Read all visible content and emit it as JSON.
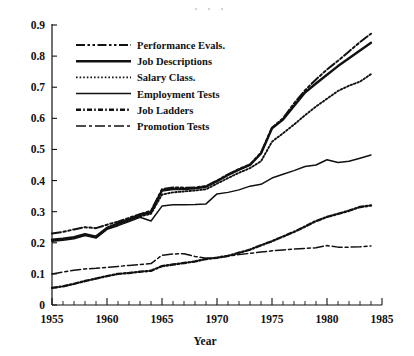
{
  "chart_data": {
    "type": "line",
    "title": "",
    "xlabel": "Year",
    "ylabel": "",
    "xlim": [
      1955,
      1985
    ],
    "ylim": [
      0,
      0.9
    ],
    "grid": false,
    "legend_position": "upper-left-inside",
    "x_ticks": [
      "1955",
      "1960",
      "1965",
      "1970",
      "1975",
      "1980",
      "1985"
    ],
    "x_tick_values": [
      1955,
      1960,
      1965,
      1970,
      1975,
      1980,
      1985
    ],
    "x_minor_step": 1,
    "y_ticks": [
      "0",
      "0.1",
      "0.2",
      "0.3",
      "0.4",
      "0.5",
      "0.6",
      "0.7",
      "0.8",
      "0.9"
    ],
    "y_tick_values": [
      0,
      0.1,
      0.2,
      0.3,
      0.4,
      0.5,
      0.6,
      0.7,
      0.8,
      0.9
    ],
    "x": [
      1955,
      1956,
      1957,
      1958,
      1959,
      1960,
      1961,
      1962,
      1963,
      1964,
      1965,
      1966,
      1967,
      1968,
      1969,
      1970,
      1971,
      1972,
      1973,
      1974,
      1975,
      1976,
      1977,
      1978,
      1979,
      1980,
      1981,
      1982,
      1983,
      1984
    ],
    "series": [
      {
        "name": "Performance Evals.",
        "dash_style": "dash-dot-dot",
        "values": [
          0.23,
          0.235,
          0.243,
          0.25,
          0.247,
          0.258,
          0.268,
          0.28,
          0.292,
          0.303,
          0.372,
          0.378,
          0.377,
          0.378,
          0.382,
          0.4,
          0.42,
          0.437,
          0.452,
          0.49,
          0.57,
          0.6,
          0.648,
          0.69,
          0.725,
          0.757,
          0.785,
          0.815,
          0.845,
          0.872
        ]
      },
      {
        "name": "Job Descriptions",
        "dash_style": "solid-thick",
        "values": [
          0.21,
          0.213,
          0.218,
          0.228,
          0.22,
          0.248,
          0.262,
          0.275,
          0.29,
          0.298,
          0.368,
          0.373,
          0.373,
          0.375,
          0.38,
          0.398,
          0.418,
          0.435,
          0.45,
          0.487,
          0.568,
          0.596,
          0.64,
          0.683,
          0.712,
          0.74,
          0.768,
          0.793,
          0.818,
          0.843
        ]
      },
      {
        "name": "Salary Class.",
        "dash_style": "dotted",
        "values": [
          0.208,
          0.212,
          0.216,
          0.225,
          0.219,
          0.245,
          0.258,
          0.271,
          0.285,
          0.293,
          0.355,
          0.362,
          0.365,
          0.368,
          0.372,
          0.39,
          0.408,
          0.425,
          0.44,
          0.462,
          0.525,
          0.552,
          0.58,
          0.61,
          0.638,
          0.663,
          0.688,
          0.705,
          0.718,
          0.742
        ]
      },
      {
        "name": "Employment Tests",
        "dash_style": "solid-thin",
        "values": [
          0.205,
          0.208,
          0.213,
          0.223,
          0.215,
          0.243,
          0.255,
          0.268,
          0.282,
          0.27,
          0.318,
          0.322,
          0.322,
          0.323,
          0.325,
          0.357,
          0.362,
          0.37,
          0.382,
          0.388,
          0.408,
          0.42,
          0.432,
          0.445,
          0.45,
          0.467,
          0.458,
          0.462,
          0.472,
          0.482
        ]
      },
      {
        "name": "Job Ladders",
        "dash_style": "dash-dot-thick",
        "values": [
          0.055,
          0.06,
          0.068,
          0.077,
          0.085,
          0.093,
          0.1,
          0.103,
          0.107,
          0.11,
          0.125,
          0.13,
          0.135,
          0.14,
          0.148,
          0.152,
          0.158,
          0.168,
          0.178,
          0.192,
          0.205,
          0.22,
          0.235,
          0.252,
          0.27,
          0.283,
          0.293,
          0.303,
          0.315,
          0.32
        ]
      },
      {
        "name": "Promotion Tests",
        "dash_style": "long-dash-dot",
        "values": [
          0.1,
          0.106,
          0.112,
          0.116,
          0.118,
          0.121,
          0.124,
          0.127,
          0.13,
          0.133,
          0.16,
          0.164,
          0.165,
          0.156,
          0.15,
          0.152,
          0.157,
          0.162,
          0.166,
          0.17,
          0.174,
          0.177,
          0.18,
          0.182,
          0.184,
          0.191,
          0.186,
          0.186,
          0.187,
          0.19
        ]
      }
    ]
  },
  "legend": {
    "entries": [
      {
        "label": "Performance Evals."
      },
      {
        "label": "Job Descriptions"
      },
      {
        "label": "Salary Class."
      },
      {
        "label": "Employment Tests"
      },
      {
        "label": "Job Ladders"
      },
      {
        "label": "Promotion Tests"
      }
    ]
  },
  "colors": {
    "ink": "#111111",
    "background": "#ffffff"
  }
}
